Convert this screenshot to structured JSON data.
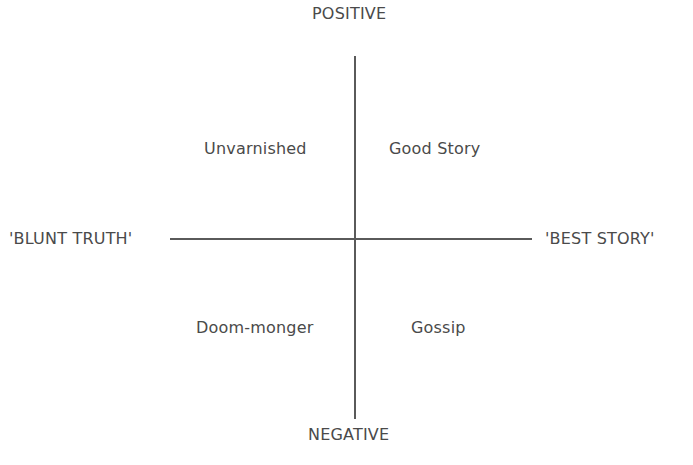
{
  "axes": {
    "top": "POSITIVE",
    "bottom": "NEGATIVE",
    "left": "'BLUNT TRUTH'",
    "right": "'BEST STORY'"
  },
  "quadrants": {
    "top_left": "Unvarnished",
    "top_right": "Good Story",
    "bottom_left": "Doom-monger",
    "bottom_right": "Gossip"
  }
}
